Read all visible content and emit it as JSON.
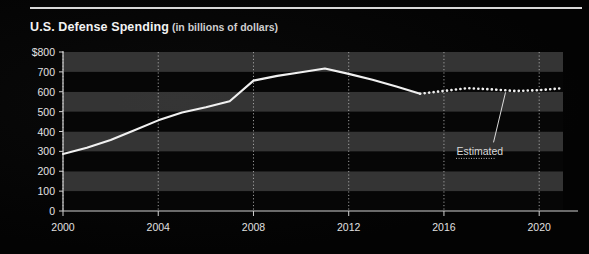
{
  "title": {
    "main": "U.S. Defense Spending",
    "sub": "(in billions of dollars)"
  },
  "colors": {
    "background": "#050505",
    "rule": "#d8d8d8",
    "band_light": "#3a3a3a",
    "band_dark": "#060606",
    "line": "#f0f0f0",
    "gridline": "#b5b5b5",
    "axis": "#d0d0d0",
    "text": "#e8e8e8"
  },
  "chart_data": {
    "type": "line",
    "title": "U.S. Defense Spending",
    "subtitle": "(in billions of dollars)",
    "xlabel": "",
    "ylabel": "",
    "xlim": [
      2000,
      2021
    ],
    "ylim": [
      0,
      800
    ],
    "yticks": [
      "$800",
      "700",
      "600",
      "500",
      "400",
      "300",
      "200",
      "100",
      "0"
    ],
    "ytick_values": [
      800,
      700,
      600,
      500,
      400,
      300,
      200,
      100,
      0
    ],
    "xticks": [
      "2000",
      "2004",
      "2008",
      "2012",
      "2016",
      "2020"
    ],
    "xtick_values": [
      2000,
      2004,
      2008,
      2012,
      2016,
      2020
    ],
    "grid": "horizontal-bands-and-vertical-tick-lines",
    "legend": "none",
    "annotations": [
      {
        "text": "Estimated",
        "x": 2017.2,
        "y": 300
      }
    ],
    "series": [
      {
        "name": "Actual",
        "style": "solid",
        "x": [
          2000,
          2001,
          2002,
          2003,
          2004,
          2005,
          2006,
          2007,
          2008,
          2009,
          2010,
          2011,
          2012,
          2013,
          2014,
          2015
        ],
        "values": [
          287,
          318,
          357,
          406,
          456,
          496,
          522,
          552,
          656,
          680,
          698,
          717,
          690,
          660,
          626,
          590
        ]
      },
      {
        "name": "Estimated",
        "style": "dotted",
        "x": [
          2015,
          2016,
          2017,
          2018,
          2019,
          2020,
          2021
        ],
        "values": [
          590,
          604,
          618,
          612,
          604,
          608,
          618
        ]
      }
    ]
  }
}
